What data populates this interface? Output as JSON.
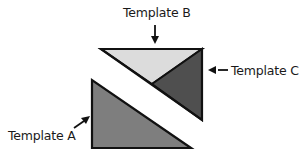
{
  "labels": {
    "template_a": "Template A",
    "template_b": "Template B",
    "template_c": "Template C"
  },
  "colors": {
    "template_a": "#7e7e7e",
    "template_b": "#dcdcdc",
    "template_c": "#4f4f4f",
    "stroke": "#111111"
  }
}
